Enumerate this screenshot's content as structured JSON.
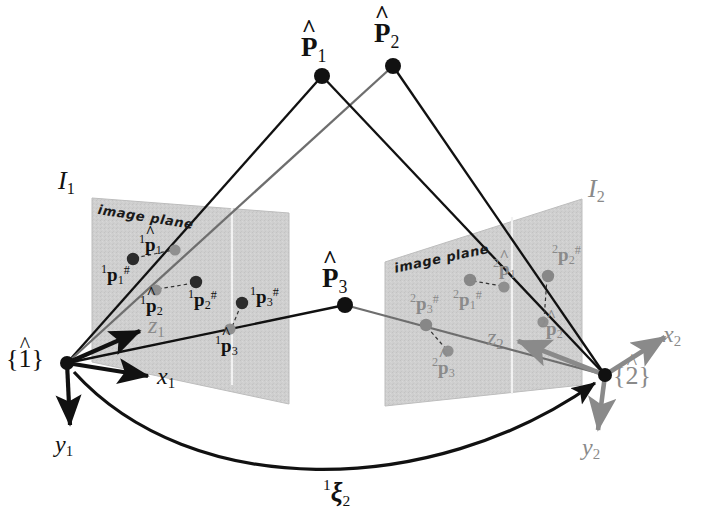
{
  "figure": {
    "background_color": "#ffffff",
    "plane_fill": "#cfcfcf",
    "dark_color": "#111111",
    "gray_color": "#8a8a8a"
  },
  "world_points": [
    {
      "id": "P1",
      "label_main": "P",
      "label_sub": "1",
      "hat": "^",
      "x": 322,
      "y": 76
    },
    {
      "id": "P2",
      "label_main": "P",
      "label_sub": "2",
      "hat": "^",
      "x": 393,
      "y": 66
    },
    {
      "id": "P3",
      "label_main": "P",
      "label_sub": "3",
      "hat": "^",
      "x": 345,
      "y": 305
    }
  ],
  "world_point_labels": {
    "p1": {
      "text": "P",
      "sub": "1",
      "hat": "^"
    },
    "p2": {
      "text": "P",
      "sub": "2",
      "hat": "^"
    },
    "p3": {
      "text": "P",
      "sub": "3",
      "hat": "^"
    }
  },
  "left_camera": {
    "frame_label": {
      "open": "{",
      "digit": "1",
      "hat": "^",
      "close": "}"
    },
    "plane_name": {
      "text": "I",
      "sub": "1"
    },
    "plane_caption": "image plane",
    "axes": [
      {
        "name": "x1",
        "text": "x",
        "sub": "1"
      },
      {
        "name": "y1",
        "text": "y",
        "sub": "1"
      },
      {
        "name": "z1",
        "text": "z",
        "sub": "1"
      }
    ],
    "image_points": [
      {
        "id": "1p1hash",
        "pre": "1",
        "base": "p",
        "sub": "1",
        "sup": "#",
        "hat": false,
        "kind": "measured"
      },
      {
        "id": "1p1hat",
        "pre": "1",
        "base": "p",
        "sub": "1",
        "sup": "",
        "hat": true,
        "kind": "estimated"
      },
      {
        "id": "1p2hash",
        "pre": "1",
        "base": "p",
        "sub": "2",
        "sup": "#",
        "hat": false,
        "kind": "measured"
      },
      {
        "id": "1p2hat",
        "pre": "1",
        "base": "p",
        "sub": "2",
        "sup": "",
        "hat": true,
        "kind": "estimated"
      },
      {
        "id": "1p3hash",
        "pre": "1",
        "base": "p",
        "sub": "3",
        "sup": "#",
        "hat": false,
        "kind": "measured"
      },
      {
        "id": "1p3hat",
        "pre": "1",
        "base": "p",
        "sub": "3",
        "sup": "",
        "hat": true,
        "kind": "estimated"
      }
    ]
  },
  "right_camera": {
    "frame_label": {
      "open": "{",
      "digit": "2",
      "hat": "^",
      "close": "}"
    },
    "plane_name": {
      "text": "I",
      "sub": "2"
    },
    "plane_caption": "image plane",
    "axes": [
      {
        "name": "x2",
        "text": "x",
        "sub": "2"
      },
      {
        "name": "y2",
        "text": "y",
        "sub": "2"
      },
      {
        "name": "z2",
        "text": "z",
        "sub": "2"
      }
    ],
    "image_points": [
      {
        "id": "2p1hash",
        "pre": "2",
        "base": "p",
        "sub": "1",
        "sup": "#",
        "hat": false,
        "kind": "measured"
      },
      {
        "id": "2p1hat",
        "pre": "2",
        "base": "p",
        "sub": "1",
        "sup": "",
        "hat": true,
        "kind": "estimated"
      },
      {
        "id": "2p2hash",
        "pre": "2",
        "base": "p",
        "sub": "2",
        "sup": "#",
        "hat": false,
        "kind": "measured"
      },
      {
        "id": "2p2hat",
        "pre": "2",
        "base": "p",
        "sub": "2",
        "sup": "",
        "hat": true,
        "kind": "estimated"
      },
      {
        "id": "2p3hash",
        "pre": "2",
        "base": "p",
        "sub": "3",
        "sup": "#",
        "hat": false,
        "kind": "measured"
      },
      {
        "id": "2p3hat",
        "pre": "2",
        "base": "p",
        "sub": "3",
        "sup": "",
        "hat": true,
        "kind": "estimated"
      }
    ]
  },
  "relative_pose": {
    "pre": "1",
    "symbol": "ξ",
    "sub": "2",
    "description": "relative pose from frame 1 to frame 2"
  }
}
